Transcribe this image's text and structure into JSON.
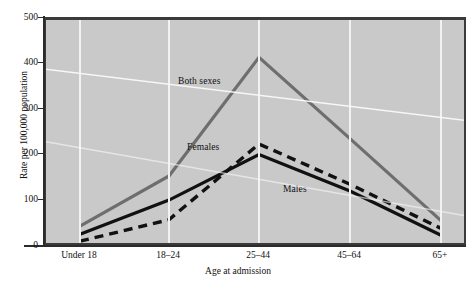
{
  "chart_data": {
    "type": "line",
    "title": "",
    "xlabel": "Age at admission",
    "ylabel": "Rate per 100,000 population",
    "categories": [
      "Under 18",
      "18–24",
      "25–44",
      "45–64",
      "65+"
    ],
    "ylim": [
      0,
      500
    ],
    "yticks": [
      0,
      100,
      200,
      300,
      400,
      500
    ],
    "grid": true,
    "legend": "inline-labels",
    "series": [
      {
        "name": "Both sexes",
        "values": [
          48,
          158,
          418,
          240,
          60
        ],
        "color": "#6e6e6e",
        "style": "solid"
      },
      {
        "name": "Females",
        "values": [
          15,
          62,
          228,
          140,
          43
        ],
        "color": "#111111",
        "style": "dashed"
      },
      {
        "name": "Males",
        "values": [
          30,
          105,
          205,
          125,
          28
        ],
        "color": "#111111",
        "style": "solid"
      }
    ],
    "annotations": [
      {
        "text": "Both sexes",
        "series": "Both sexes"
      },
      {
        "text": "Females",
        "series": "Females"
      },
      {
        "text": "Males",
        "series": "Males"
      }
    ]
  },
  "axes": {
    "y": {
      "title": "Rate per 100,000 population",
      "ticks": [
        "500",
        "400",
        "300",
        "200",
        "100",
        "0"
      ]
    },
    "x": {
      "title": "Age at admission",
      "ticks": [
        "Under 18",
        "18–24",
        "25–44",
        "45–64",
        "65+"
      ]
    }
  },
  "series_labels": {
    "both_sexes": "Both sexes",
    "females": "Females",
    "males": "Males"
  },
  "colors": {
    "plot_background": "#c9c9c9",
    "gridline": "#f2f2f2",
    "frame": "#3a3a3a",
    "both_sexes": "#6e6e6e",
    "females": "#111111",
    "males": "#111111"
  }
}
